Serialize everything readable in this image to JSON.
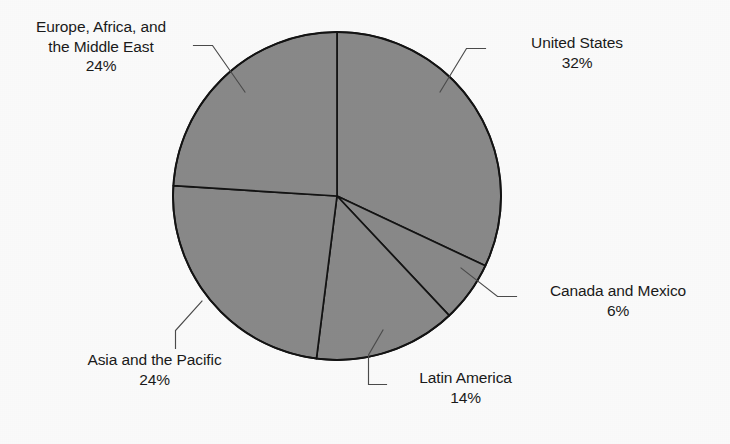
{
  "chart_data": {
    "type": "pie",
    "title": "",
    "subtitle": "",
    "xlabel": "",
    "ylabel": "",
    "legend_position": "none",
    "grid": false,
    "labels_show_percent": true,
    "start_angle_deg": 0,
    "direction": "clockwise",
    "categories": [
      "United States",
      "Canada and Mexico",
      "Latin America",
      "Asia and the Pacific",
      "Europe, Africa, and the Middle East"
    ],
    "values": [
      32,
      6,
      14,
      24,
      24
    ],
    "value_labels": [
      "32%",
      "6%",
      "14%",
      "24%",
      "24%"
    ],
    "units": "percent",
    "total": 100,
    "slice_fill": "#8a8a8a",
    "slice_stroke": "#141414",
    "background": "#fdfdfd",
    "text_color": "#1a1a1a"
  },
  "chart": {
    "geometry": {
      "center_x": 337,
      "center_y": 196,
      "radius": 164
    },
    "colors": {
      "slice_fill": "#8a8a8a",
      "slice_stroke": "#141414",
      "leader_line": "#4c4c4c",
      "text": "#1a1a1a",
      "background": "#fdfdfd"
    },
    "slices": [
      {
        "id": "united-states",
        "name": "United States",
        "percent_label": "32%",
        "percent": 32,
        "start_deg": 0,
        "end_deg": 115.2
      },
      {
        "id": "canada-and-mexico",
        "name": "Canada and Mexico",
        "percent_label": "6%",
        "percent": 6,
        "start_deg": 115.2,
        "end_deg": 136.8
      },
      {
        "id": "latin-america",
        "name": "Latin America",
        "percent_label": "14%",
        "percent": 14,
        "start_deg": 136.8,
        "end_deg": 187.2
      },
      {
        "id": "asia-and-the-pacific",
        "name": "Asia and the Pacific",
        "percent_label": "24%",
        "percent": 24,
        "start_deg": 187.2,
        "end_deg": 273.6
      },
      {
        "id": "europe-africa-middle-east",
        "name": "Europe, Africa, and the Middle East",
        "percent_label": "24%",
        "percent": 24,
        "start_deg": 273.6,
        "end_deg": 360
      }
    ]
  },
  "labels": {
    "europe_africa_middle_east": {
      "line1": "Europe, Africa, and",
      "line2": "the Middle East",
      "value": "24%"
    },
    "united_states": {
      "line1": "United States",
      "value": "32%"
    },
    "canada_and_mexico": {
      "line1": "Canada and Mexico",
      "value": "6%"
    },
    "latin_america": {
      "line1": "Latin America",
      "value": "14%"
    },
    "asia_and_the_pacific": {
      "line1": "Asia and the Pacific",
      "value": "24%"
    }
  }
}
